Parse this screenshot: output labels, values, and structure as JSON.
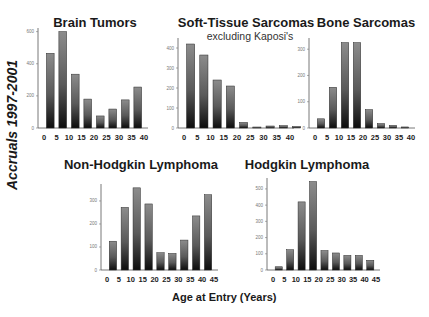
{
  "figure": {
    "y_axis_label": "Accruals 1997-2001",
    "x_axis_label": "Age at Entry  (Years)"
  },
  "chart_data": [
    {
      "type": "bar",
      "title": "Brain Tumors",
      "subtitle": "",
      "xlabel": "Age at Entry (Years)",
      "ylabel": "Accruals 1997-2001",
      "x_ticks": [
        "0",
        "5",
        "10",
        "15",
        "20",
        "25",
        "30",
        "35",
        "40"
      ],
      "categories": [
        "0-4",
        "5-9",
        "10-14",
        "15-19",
        "20-24",
        "25-29",
        "30-34",
        "35-39"
      ],
      "values": [
        465,
        600,
        335,
        180,
        75,
        118,
        175,
        255
      ],
      "y_ticks": [
        0,
        200,
        400,
        600
      ],
      "ylim": [
        0,
        610
      ],
      "grid": false
    },
    {
      "type": "bar",
      "title": "Soft-Tissue Sarcomas",
      "subtitle": "excluding Kaposi's",
      "xlabel": "Age at Entry (Years)",
      "ylabel": "Accruals 1997-2001",
      "x_ticks": [
        "0",
        "5",
        "10",
        "15",
        "20",
        "25",
        "30",
        "35",
        "40"
      ],
      "categories": [
        "0-4",
        "5-9",
        "10-14",
        "15-19",
        "20-24",
        "25-29",
        "30-34",
        "35-39",
        "40+"
      ],
      "values": [
        420,
        365,
        240,
        210,
        28,
        5,
        10,
        12,
        8
      ],
      "y_ticks": [
        0,
        100,
        200,
        300,
        400
      ],
      "ylim": [
        0,
        440
      ],
      "grid": false
    },
    {
      "type": "bar",
      "title": "Bone Sarcomas",
      "subtitle": "",
      "xlabel": "Age at Entry (Years)",
      "ylabel": "Accruals 1997-2001",
      "x_ticks": [
        "0",
        "5",
        "10",
        "15",
        "20",
        "25",
        "30",
        "35",
        "40"
      ],
      "categories": [
        "0-4",
        "5-9",
        "10-14",
        "15-19",
        "20-24",
        "25-29",
        "30-34",
        "35-39"
      ],
      "values": [
        35,
        155,
        325,
        325,
        70,
        17,
        10,
        4
      ],
      "y_ticks": [
        0,
        100,
        200,
        300
      ],
      "ylim": [
        0,
        335
      ],
      "grid": false
    },
    {
      "type": "bar",
      "title": "Non-Hodgkin Lymphoma",
      "subtitle": "",
      "xlabel": "Age at Entry (Years)",
      "ylabel": "Accruals 1997-2001",
      "x_ticks": [
        "0",
        "5",
        "10",
        "15",
        "20",
        "25",
        "30",
        "35",
        "40",
        "45"
      ],
      "categories": [
        "0-4",
        "5-9",
        "10-14",
        "15-19",
        "20-24",
        "25-29",
        "30-34",
        "35-39",
        "40-44"
      ],
      "values": [
        125,
        272,
        357,
        287,
        75,
        72,
        130,
        235,
        327
      ],
      "y_ticks": [
        0,
        100,
        200,
        300
      ],
      "ylim": [
        0,
        365
      ],
      "grid": false
    },
    {
      "type": "bar",
      "title": "Hodgkin Lymphoma",
      "subtitle": "",
      "xlabel": "Age at Entry (Years)",
      "ylabel": "Accruals 1997-2001",
      "x_ticks": [
        "0",
        "5",
        "10",
        "15",
        "20",
        "25",
        "30",
        "35",
        "40",
        "45"
      ],
      "categories": [
        "0-4",
        "5-9",
        "10-14",
        "15-19",
        "20-24",
        "25-29",
        "30-34",
        "35-39",
        "40-44"
      ],
      "values": [
        20,
        125,
        420,
        545,
        120,
        105,
        90,
        90,
        60
      ],
      "y_ticks": [
        0,
        100,
        200,
        300,
        400,
        500
      ],
      "ylim": [
        0,
        555
      ],
      "grid": false
    }
  ]
}
